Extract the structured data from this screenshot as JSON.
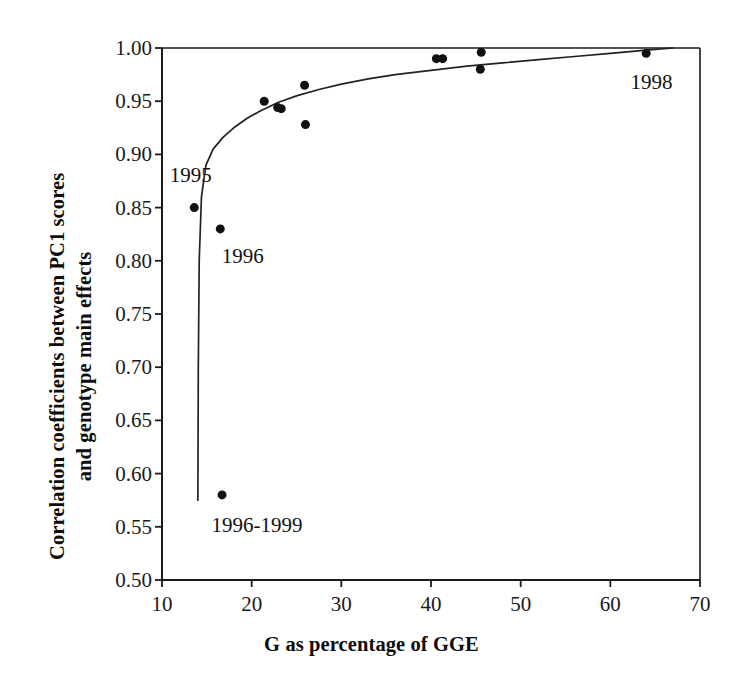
{
  "chart_data": {
    "type": "scatter",
    "title": "",
    "xlabel": "G as percentage of GGE",
    "ylabel": "Correlation coefficients between PC1 scores and genotype main effects",
    "ylabel_line1": "Correlation coefficients between PC1 scores",
    "ylabel_line2": "and genotype main effects",
    "xlim": [
      10,
      70
    ],
    "ylim": [
      0.5,
      1.0
    ],
    "xticks": [
      10,
      20,
      30,
      40,
      50,
      60,
      70
    ],
    "yticks": [
      0.5,
      0.55,
      0.6,
      0.65,
      0.7,
      0.75,
      0.8,
      0.85,
      0.9,
      0.95,
      1.0
    ],
    "xtick_labels": [
      "10",
      "20",
      "30",
      "40",
      "50",
      "60",
      "70"
    ],
    "ytick_labels": [
      "0.50",
      "0.55",
      "0.60",
      "0.65",
      "0.70",
      "0.75",
      "0.80",
      "0.85",
      "0.90",
      "0.95",
      "1.00"
    ],
    "grid": false,
    "legend": false,
    "marker": "filled-circle",
    "marker_color": "#111111",
    "marker_size_px": 9,
    "line_color": "#222222",
    "points": [
      {
        "x": 13.6,
        "y": 0.85,
        "label": "1995"
      },
      {
        "x": 16.5,
        "y": 0.83,
        "label": "1996"
      },
      {
        "x": 16.7,
        "y": 0.58,
        "label": "1996-1999"
      },
      {
        "x": 21.4,
        "y": 0.95,
        "label": ""
      },
      {
        "x": 22.9,
        "y": 0.944,
        "label": ""
      },
      {
        "x": 23.3,
        "y": 0.943,
        "label": ""
      },
      {
        "x": 25.9,
        "y": 0.965,
        "label": ""
      },
      {
        "x": 26.0,
        "y": 0.928,
        "label": ""
      },
      {
        "x": 40.6,
        "y": 0.99,
        "label": ""
      },
      {
        "x": 41.3,
        "y": 0.99,
        "label": ""
      },
      {
        "x": 45.6,
        "y": 0.996,
        "label": ""
      },
      {
        "x": 45.5,
        "y": 0.98,
        "label": ""
      },
      {
        "x": 64.0,
        "y": 0.995,
        "label": "1998"
      }
    ],
    "fitted_curve": {
      "description": "asymptotic fitted curve rising steeply from x=14 and approaching 1.00",
      "points": [
        {
          "x": 14.0,
          "y": 0.575
        },
        {
          "x": 14.05,
          "y": 0.7
        },
        {
          "x": 14.15,
          "y": 0.8
        },
        {
          "x": 14.4,
          "y": 0.86
        },
        {
          "x": 14.9,
          "y": 0.89
        },
        {
          "x": 15.7,
          "y": 0.905
        },
        {
          "x": 16.8,
          "y": 0.916
        },
        {
          "x": 18.0,
          "y": 0.925
        },
        {
          "x": 19.5,
          "y": 0.934
        },
        {
          "x": 21.0,
          "y": 0.941
        },
        {
          "x": 23.0,
          "y": 0.949
        },
        {
          "x": 25.0,
          "y": 0.955
        },
        {
          "x": 27.5,
          "y": 0.961
        },
        {
          "x": 30.0,
          "y": 0.966
        },
        {
          "x": 33.0,
          "y": 0.971
        },
        {
          "x": 36.0,
          "y": 0.975
        },
        {
          "x": 40.0,
          "y": 0.979
        },
        {
          "x": 44.0,
          "y": 0.983
        },
        {
          "x": 48.0,
          "y": 0.986
        },
        {
          "x": 52.0,
          "y": 0.989
        },
        {
          "x": 56.0,
          "y": 0.992
        },
        {
          "x": 60.0,
          "y": 0.995
        },
        {
          "x": 64.0,
          "y": 0.998
        },
        {
          "x": 67.0,
          "y": 1.0
        }
      ]
    },
    "annotations": [
      {
        "text": "1995",
        "x": 13.2,
        "y": 0.881,
        "anchor": "center"
      },
      {
        "text": "1996",
        "x": 19.0,
        "y": 0.805,
        "anchor": "center"
      },
      {
        "text": "1996-1999",
        "x": 20.6,
        "y": 0.552,
        "anchor": "center"
      },
      {
        "text": "1998",
        "x": 64.6,
        "y": 0.968,
        "anchor": "center"
      }
    ]
  },
  "plot_frame": {
    "left_px": 162,
    "right_px": 700,
    "top_px": 48,
    "bottom_px": 580
  }
}
